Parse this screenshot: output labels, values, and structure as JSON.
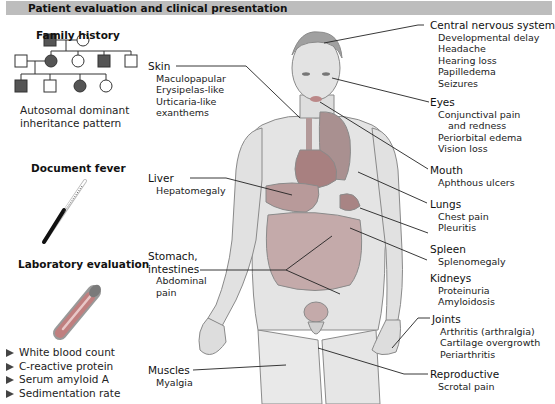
{
  "header": {
    "title": "Patient evaluation and clinical presentation"
  },
  "left_panel": {
    "family_history": {
      "title": "Family history",
      "caption_line1": "Autosomal dominant",
      "caption_line2": "inheritance pattern",
      "pedigree": {
        "generation1": [
          {
            "sex": "male",
            "affected": true
          },
          {
            "sex": "female",
            "affected": false
          }
        ],
        "generation2": [
          {
            "sex": "male",
            "affected": false
          },
          {
            "sex": "female",
            "affected": true
          },
          {
            "sex": "female",
            "affected": false
          },
          {
            "sex": "male",
            "affected": true
          },
          {
            "sex": "male",
            "affected": false
          }
        ],
        "generation3": [
          {
            "sex": "male",
            "affected": true
          },
          {
            "sex": "male",
            "affected": false
          },
          {
            "sex": "female",
            "affected": true
          },
          {
            "sex": "female",
            "affected": false
          }
        ]
      }
    },
    "fever": {
      "title": "Document fever"
    },
    "lab": {
      "title": "Laboratory evaluation",
      "items": [
        "White blood count",
        "C-reactive protein",
        "Serum amyloid A",
        "Sedimentation rate"
      ]
    }
  },
  "organs": {
    "skin": {
      "name": "Skin",
      "symptoms": [
        "Maculopapular",
        "Erysipelas-like",
        "Urticaria-like",
        "exanthems"
      ]
    },
    "liver": {
      "name": "Liver",
      "symptoms": [
        "Hepatomegaly"
      ]
    },
    "gi": {
      "name_line1": "Stomach,",
      "name_line2": "intestines",
      "symptoms": [
        "Abdominal",
        "pain"
      ]
    },
    "muscles": {
      "name": "Muscles",
      "symptoms": [
        "Myalgia"
      ]
    },
    "cns": {
      "name": "Central nervous system",
      "symptoms": [
        "Developmental delay",
        "Headache",
        "Hearing loss",
        "Papilledema",
        "Seizures"
      ]
    },
    "eyes": {
      "name": "Eyes",
      "symptoms": [
        "Conjunctival pain",
        "and redness",
        "Periorbital edema",
        "Vision loss"
      ]
    },
    "mouth": {
      "name": "Mouth",
      "symptoms": [
        "Aphthous ulcers"
      ]
    },
    "lungs": {
      "name": "Lungs",
      "symptoms": [
        "Chest pain",
        "Pleuritis"
      ]
    },
    "spleen": {
      "name": "Spleen",
      "symptoms": [
        "Splenomegaly"
      ]
    },
    "kidneys": {
      "name": "Kidneys",
      "symptoms": [
        "Proteinuria",
        "Amyloidosis"
      ]
    },
    "joints": {
      "name": "Joints",
      "symptoms": [
        "Arthritis (arthralgia)",
        "Cartilage overgrowth",
        "Periarthritis"
      ]
    },
    "reproductive": {
      "name": "Reproductive",
      "symptoms": [
        "Scrotal pain"
      ]
    }
  },
  "colors": {
    "header_bg": "#bdbdbd",
    "affected_fill": "#555555",
    "organ_red": "#9a8080",
    "skin": "#e6e6e6"
  }
}
